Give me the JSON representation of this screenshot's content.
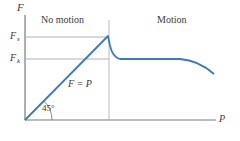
{
  "figure": {
    "y_axis_label": "F",
    "x_axis_label": "P",
    "regions": {
      "left": "No motion",
      "right": "Motion"
    },
    "levels": {
      "static": {
        "symbol": "F",
        "subscript": "s"
      },
      "kinetic": {
        "symbol": "F",
        "subscript": "k"
      }
    },
    "line_label": "F = P",
    "angle_label": "45°",
    "colors": {
      "curve": "#3c7ab8",
      "axis": "#6e6e6e",
      "guide": "#a8a8a8",
      "text": "#3a3a3a"
    }
  }
}
